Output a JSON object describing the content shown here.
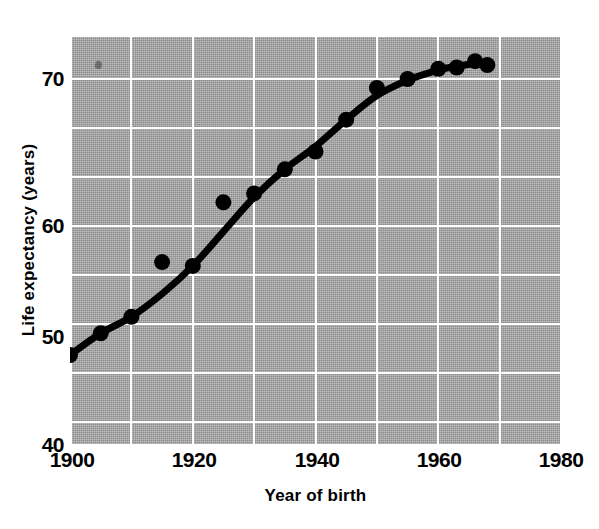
{
  "chart_data": {
    "type": "scatter",
    "title": "",
    "subtitle": "",
    "xlabel": "Year of birth",
    "ylabel": "Life expectancy (years)",
    "xlim": [
      1900,
      1980
    ],
    "ylim": [
      40,
      72
    ],
    "xticks": [
      1900,
      1920,
      1940,
      1960,
      1980
    ],
    "xtick_labels": [
      "1900",
      "1920",
      "1940",
      "1960",
      "1980"
    ],
    "yticks": [
      40,
      50,
      60,
      70
    ],
    "ytick_labels": [
      "40",
      "50",
      "60",
      "70"
    ],
    "grid": "on",
    "grid_color": "#ffffff",
    "grid_x_interval": 10,
    "grid_y_interval": 4,
    "panel_color": "#a8a8a8",
    "marker_color": "#000000",
    "line_color": "#000000",
    "legend": "none",
    "annotations": [],
    "series": [
      {
        "name": "Observed life expectancy",
        "marker": "filled-circle",
        "x": [
          1900,
          1905,
          1910,
          1915,
          1920,
          1925,
          1930,
          1935,
          1940,
          1945,
          1950,
          1955,
          1960,
          1963,
          1966,
          1968
        ],
        "y": [
          47.0,
          48.7,
          50.0,
          54.3,
          54.0,
          59.0,
          59.7,
          61.6,
          63.0,
          65.5,
          68.0,
          68.7,
          69.5,
          69.6,
          70.1,
          69.8
        ]
      },
      {
        "name": "Fitted smooth curve",
        "marker": "none",
        "x": [
          1900,
          1905,
          1910,
          1915,
          1920,
          1925,
          1930,
          1935,
          1940,
          1945,
          1950,
          1955,
          1960,
          1963,
          1966,
          1968
        ],
        "y": [
          47.0,
          48.7,
          50.0,
          51.8,
          54.0,
          56.7,
          59.4,
          61.6,
          63.4,
          65.5,
          67.4,
          68.6,
          69.4,
          69.7,
          69.9,
          69.8
        ]
      }
    ]
  }
}
